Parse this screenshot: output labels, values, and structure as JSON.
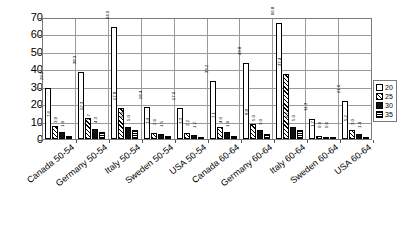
{
  "chart_data": {
    "type": "bar",
    "title": "",
    "xlabel": "",
    "ylabel": "",
    "ylim": [
      0,
      70
    ],
    "yticks": [
      0,
      10,
      20,
      30,
      40,
      50,
      60,
      70
    ],
    "grid": true,
    "legend_position": "right",
    "categories": [
      "Canada 50-54",
      "Germany 50-54",
      "Italy 50-54",
      "Sweden 50-54",
      "USA 50-54",
      "Canada 60-64",
      "Germany 60-64",
      "Italy 60-64",
      "Sweden 60-64",
      "USA 60-64"
    ],
    "series": [
      {
        "name": "20",
        "swatch": "white",
        "values": [
          29.0,
          38.3,
          64.0,
          18.4,
          17.6,
          33.2,
          43.8,
          66.8,
          11.3,
          21.6
        ],
        "labels": [
          "29.0",
          "38.3",
          "64.0",
          "18.4",
          "17.6",
          "33.2",
          "43.8",
          "66.8",
          "11.3",
          "21.6"
        ]
      },
      {
        "name": "25",
        "swatch": "hatch-diagonal",
        "values": [
          7.6,
          12.3,
          17.8,
          3.4,
          3.3,
          7.1,
          8.8,
          37.4,
          1.7,
          5.2
        ],
        "labels": [
          "7.6",
          "12.3",
          "17.8",
          "3.4",
          "3.3",
          "7.1",
          "8.8",
          "37.4",
          "1.7",
          "5.2"
        ]
      },
      {
        "name": "30",
        "swatch": "black",
        "values": [
          3.9,
          5.7,
          6.9,
          2.6,
          2.2,
          4.0,
          5.0,
          6.7,
          0.9,
          3.0
        ],
        "labels": [
          "3.9",
          "5.7",
          "6.9",
          "2.6",
          "2.2",
          "4.0",
          "5.0",
          "6.7",
          "0.9",
          "3.0"
        ]
      },
      {
        "name": "35",
        "swatch": "hatch-horizontal",
        "values": [
          1.9,
          4.3,
          5.0,
          1.5,
          1.2,
          1.9,
          3.0,
          5.0,
          0.6,
          1.4
        ],
        "labels": [
          "1.9",
          "4.3",
          "5.0",
          "1.5",
          "1.2",
          "1.9",
          "3.0",
          "5.0",
          "0.6",
          "1.4"
        ]
      }
    ]
  },
  "legend": {
    "items": [
      {
        "label": "20"
      },
      {
        "label": "25"
      },
      {
        "label": "30"
      },
      {
        "label": "35"
      }
    ]
  }
}
